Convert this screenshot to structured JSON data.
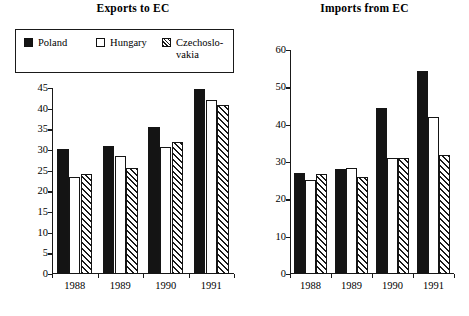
{
  "legend": {
    "entries": [
      {
        "label": "Poland",
        "style": "solid",
        "color": "#141414"
      },
      {
        "label": "Hungary",
        "style": "open",
        "color": "#ffffff"
      },
      {
        "label": "Czechoslo-vakia",
        "style": "hatch",
        "color": "#1a1a1a"
      }
    ]
  },
  "chart_data": [
    {
      "type": "bar",
      "title": "Exports to EC",
      "xlabel": "",
      "ylabel": "",
      "categories": [
        "1988",
        "1989",
        "1990",
        "1991"
      ],
      "series": [
        {
          "name": "Poland",
          "values": [
            30.2,
            31.0,
            35.6,
            44.8
          ]
        },
        {
          "name": "Hungary",
          "values": [
            23.4,
            28.5,
            30.7,
            42.0
          ]
        },
        {
          "name": "Czechoslovakia",
          "values": [
            24.1,
            25.7,
            32.0,
            40.8
          ]
        }
      ],
      "ylim": [
        0,
        45
      ],
      "yticks": [
        0,
        5,
        10,
        15,
        20,
        25,
        30,
        35,
        40,
        45
      ],
      "grid": false,
      "legend_position": "above-left"
    },
    {
      "type": "bar",
      "title": "Imports from EC",
      "xlabel": "",
      "ylabel": "",
      "categories": [
        "1988",
        "1989",
        "1990",
        "1991"
      ],
      "series": [
        {
          "name": "Poland",
          "values": [
            27.0,
            28.0,
            44.5,
            54.3
          ]
        },
        {
          "name": "Hungary",
          "values": [
            25.2,
            28.5,
            31.0,
            42.0
          ]
        },
        {
          "name": "Czechoslovakia",
          "values": [
            26.7,
            26.0,
            31.2,
            32.0
          ]
        }
      ],
      "ylim": [
        0,
        60
      ],
      "yticks": [
        0,
        10,
        20,
        30,
        40,
        50,
        60
      ],
      "grid": false,
      "legend_position": "none"
    }
  ]
}
